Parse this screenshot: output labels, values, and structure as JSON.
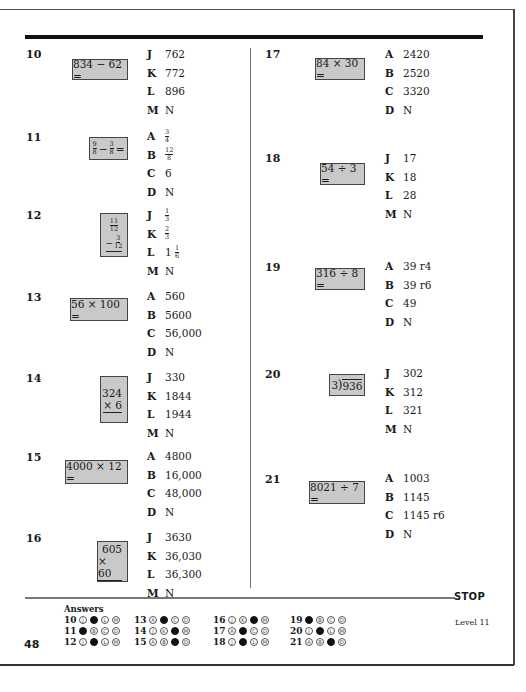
{
  "page": {
    "page_number": "48",
    "stop_label": "STOP",
    "level_label": "Level 11"
  },
  "questions": [
    {
      "num": "10",
      "problem": "834 − 62 =",
      "choices": [
        {
          "letter": "J",
          "value": "762"
        },
        {
          "letter": "K",
          "value": "772"
        },
        {
          "letter": "L",
          "value": "896"
        },
        {
          "letter": "M",
          "value": "N"
        }
      ]
    },
    {
      "num": "11",
      "problem_parts": {
        "a_num": "9",
        "a_den": "8",
        "op": "−",
        "b_num": "3",
        "b_den": "8",
        "eq": "="
      },
      "choices": [
        {
          "letter": "A",
          "value": "",
          "frac": {
            "num": "3",
            "den": "4"
          }
        },
        {
          "letter": "B",
          "value": "",
          "frac": {
            "num": "12",
            "den": "8"
          }
        },
        {
          "letter": "C",
          "value": "6"
        },
        {
          "letter": "D",
          "value": "N"
        }
      ]
    },
    {
      "num": "12",
      "problem_vertical": {
        "top_num": "11",
        "top_den": "12",
        "op": "−",
        "bot_num": "3",
        "bot_den": "12"
      },
      "choices": [
        {
          "letter": "J",
          "value": "",
          "frac": {
            "num": "1",
            "den": "3"
          }
        },
        {
          "letter": "K",
          "value": "",
          "frac": {
            "num": "2",
            "den": "3"
          }
        },
        {
          "letter": "L",
          "value": "1",
          "frac": {
            "num": "1",
            "den": "6"
          }
        },
        {
          "letter": "M",
          "value": "N"
        }
      ]
    },
    {
      "num": "13",
      "problem": "56 × 100 =",
      "choices": [
        {
          "letter": "A",
          "value": "560"
        },
        {
          "letter": "B",
          "value": "5600"
        },
        {
          "letter": "C",
          "value": "56,000"
        },
        {
          "letter": "D",
          "value": "N"
        }
      ]
    },
    {
      "num": "14",
      "problem_vertical_int": {
        "top": "324",
        "bottom": "× 6"
      },
      "choices": [
        {
          "letter": "J",
          "value": "330"
        },
        {
          "letter": "K",
          "value": "1844"
        },
        {
          "letter": "L",
          "value": "1944"
        },
        {
          "letter": "M",
          "value": "N"
        }
      ]
    },
    {
      "num": "15",
      "problem": "4000 × 12 =",
      "choices": [
        {
          "letter": "A",
          "value": "4800"
        },
        {
          "letter": "B",
          "value": "16,000"
        },
        {
          "letter": "C",
          "value": "48,000"
        },
        {
          "letter": "D",
          "value": "N"
        }
      ]
    },
    {
      "num": "16",
      "problem_vertical_int": {
        "top": "605",
        "bottom": "× 60"
      },
      "choices": [
        {
          "letter": "J",
          "value": "3630"
        },
        {
          "letter": "K",
          "value": "36,030"
        },
        {
          "letter": "L",
          "value": "36,300"
        },
        {
          "letter": "M",
          "value": "N"
        }
      ]
    },
    {
      "num": "17",
      "problem": "84 × 30 =",
      "choices": [
        {
          "letter": "A",
          "value": "2420"
        },
        {
          "letter": "B",
          "value": "2520"
        },
        {
          "letter": "C",
          "value": "3320"
        },
        {
          "letter": "D",
          "value": "N"
        }
      ]
    },
    {
      "num": "18",
      "problem": "54 ÷ 3 =",
      "choices": [
        {
          "letter": "J",
          "value": "17"
        },
        {
          "letter": "K",
          "value": "18"
        },
        {
          "letter": "L",
          "value": "28"
        },
        {
          "letter": "M",
          "value": "N"
        }
      ]
    },
    {
      "num": "19",
      "problem": "316 ÷ 8 =",
      "choices": [
        {
          "letter": "A",
          "value": "39 r4"
        },
        {
          "letter": "B",
          "value": "39 r6"
        },
        {
          "letter": "C",
          "value": "49"
        },
        {
          "letter": "D",
          "value": "N"
        }
      ]
    },
    {
      "num": "20",
      "problem_longdiv": {
        "divisor": "3",
        "dividend": "936"
      },
      "choices": [
        {
          "letter": "J",
          "value": "302"
        },
        {
          "letter": "K",
          "value": "312"
        },
        {
          "letter": "L",
          "value": "321"
        },
        {
          "letter": "M",
          "value": "N"
        }
      ]
    },
    {
      "num": "21",
      "problem": "8021 ÷ 7 =",
      "choices": [
        {
          "letter": "A",
          "value": "1003"
        },
        {
          "letter": "B",
          "value": "1145"
        },
        {
          "letter": "C",
          "value": "1145 r6"
        },
        {
          "letter": "D",
          "value": "N"
        }
      ]
    }
  ],
  "answers": {
    "title": "Answers",
    "rows": [
      {
        "num": "10",
        "options": [
          "J",
          "K",
          "L",
          "M"
        ],
        "filled": 1
      },
      {
        "num": "11",
        "options": [
          "A",
          "B",
          "C",
          "D"
        ],
        "filled": 0
      },
      {
        "num": "12",
        "options": [
          "J",
          "K",
          "L",
          "M"
        ],
        "filled": 1
      },
      {
        "num": "13",
        "options": [
          "A",
          "B",
          "C",
          "D"
        ],
        "filled": 1
      },
      {
        "num": "14",
        "options": [
          "J",
          "K",
          "L",
          "M"
        ],
        "filled": 2
      },
      {
        "num": "15",
        "options": [
          "A",
          "B",
          "C",
          "D"
        ],
        "filled": 2
      },
      {
        "num": "16",
        "options": [
          "J",
          "K",
          "L",
          "M"
        ],
        "filled": 2
      },
      {
        "num": "17",
        "options": [
          "A",
          "B",
          "C",
          "D"
        ],
        "filled": 1
      },
      {
        "num": "18",
        "options": [
          "J",
          "K",
          "L",
          "M"
        ],
        "filled": 1
      },
      {
        "num": "19",
        "options": [
          "A",
          "B",
          "C",
          "D"
        ],
        "filled": 0
      },
      {
        "num": "20",
        "options": [
          "J",
          "K",
          "L",
          "M"
        ],
        "filled": 1
      },
      {
        "num": "21",
        "options": [
          "A",
          "B",
          "C",
          "D"
        ],
        "filled": 2
      }
    ]
  },
  "colors": {
    "box_fill": "#c9c9c9",
    "rule": "#111111"
  }
}
